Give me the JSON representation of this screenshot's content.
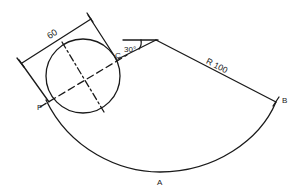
{
  "diagram": {
    "type": "engineering-drawing",
    "labels": {
      "dimension_width": "60",
      "angle": "30°",
      "radius": "R 100",
      "point_c": "C",
      "point_b": "B",
      "point_p": "P",
      "point_a": "A"
    },
    "colors": {
      "stroke": "#1a1a1a",
      "background": "#ffffff"
    }
  }
}
